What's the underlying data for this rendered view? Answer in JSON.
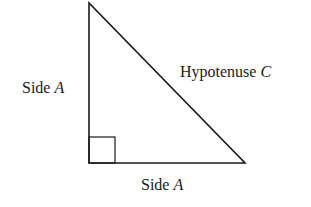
{
  "diagram": {
    "labels": {
      "left_side": {
        "text": "Side ",
        "var": "A"
      },
      "hypotenuse": {
        "text": "Hypotenuse ",
        "var": "C"
      },
      "bottom_side": {
        "text": "Side ",
        "var": "A"
      }
    },
    "colors": {
      "stroke": "#1a1a1a",
      "background": "#ffffff"
    }
  }
}
